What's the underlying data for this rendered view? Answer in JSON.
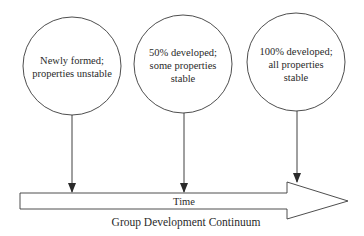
{
  "diagram": {
    "caption": "Group Development Continuum",
    "axis_label": "Time",
    "stages": [
      {
        "lines": [
          "Newly formed;",
          "properties unstable"
        ]
      },
      {
        "lines": [
          "50% developed;",
          "some properties",
          "stable"
        ]
      },
      {
        "lines": [
          "100% developed;",
          "all properties",
          "stable"
        ]
      }
    ],
    "colors": {
      "stroke": "#3a3a3a",
      "text": "#2a2a2a",
      "background": "#ffffff"
    }
  }
}
